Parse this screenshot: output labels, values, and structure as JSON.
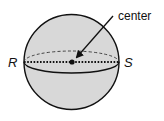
{
  "figure": {
    "type": "sphere-diagram",
    "labels": {
      "center": "center",
      "left_point": "R",
      "right_point": "S"
    },
    "colors": {
      "sphere_fill": "#d8d8d8",
      "stroke": "#111111",
      "background": "#ffffff"
    },
    "geometry": {
      "sphere_center": [
        71.5,
        62
      ],
      "sphere_radius": 47.5,
      "equator_rx": 47.5,
      "equator_ry": 11,
      "arrow_start": [
        113,
        16
      ],
      "arrow_end": [
        76,
        58
      ],
      "center_dot_radius": 2.6
    }
  }
}
